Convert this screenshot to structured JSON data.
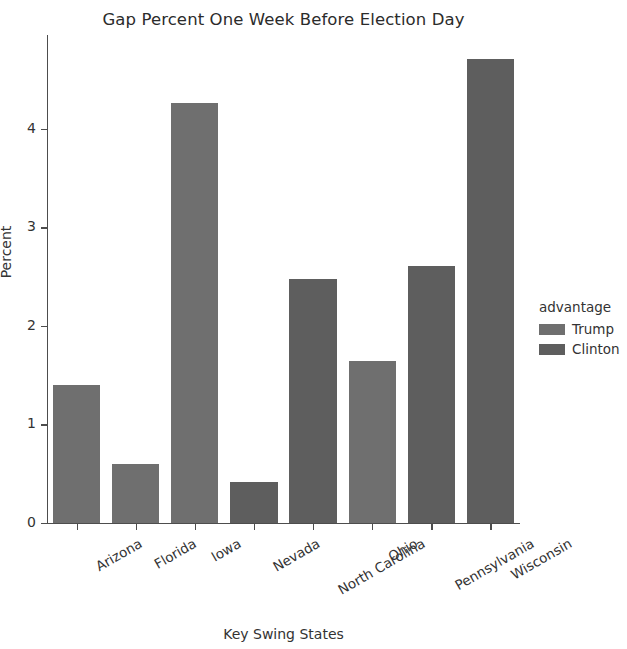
{
  "chart_data": {
    "type": "bar",
    "title": "Gap Percent One Week Before Election Day",
    "xlabel": "Key Swing States",
    "ylabel": "Percent",
    "categories": [
      "Arizona",
      "Florida",
      "Iowa",
      "Nevada",
      "North Carolina",
      "Ohio",
      "Pennsylvania",
      "Wisconsin"
    ],
    "values": [
      1.4,
      0.6,
      4.26,
      0.42,
      2.48,
      1.64,
      2.61,
      4.71
    ],
    "groups": [
      "Trump",
      "Trump",
      "Trump",
      "Clinton",
      "Clinton",
      "Trump",
      "Clinton",
      "Clinton"
    ],
    "ylim": [
      0,
      4.95
    ],
    "yticks": [
      0,
      1,
      2,
      3,
      4
    ],
    "ytick_labels": [
      "0",
      "1",
      "2",
      "3",
      "4"
    ],
    "grid": false,
    "legend": {
      "title": "advantage",
      "position": "right",
      "entries": [
        {
          "label": "Trump",
          "color": "#6f6f6f"
        },
        {
          "label": "Clinton",
          "color": "#5e5e5e"
        }
      ]
    },
    "colors": {
      "trump": "#6f6f6f",
      "clinton": "#5e5e5e",
      "axis": "#4d4d4d",
      "text": "#333333",
      "background": "#ffffff"
    }
  }
}
